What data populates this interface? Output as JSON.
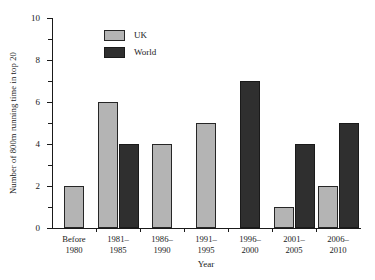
{
  "chart_data": {
    "type": "bar",
    "title": "",
    "xlabel": "Year",
    "ylabel": "Number of 800m running time in top 20",
    "categories": [
      "Before 1980",
      "1981–1985",
      "1986–1990",
      "1991–1995",
      "1996–2000",
      "2001–2005",
      "2006–2010"
    ],
    "category_lines": [
      [
        "Before",
        "1980"
      ],
      [
        "1981–",
        "1985"
      ],
      [
        "1986–",
        "1990"
      ],
      [
        "1991–",
        "1995"
      ],
      [
        "1996–",
        "2000"
      ],
      [
        "2001–",
        "2005"
      ],
      [
        "2006–",
        "2010"
      ]
    ],
    "series": [
      {
        "name": "UK",
        "color": "#b4b4b4",
        "values": [
          2,
          6,
          4,
          5,
          0,
          1,
          2
        ]
      },
      {
        "name": "World",
        "color": "#2f2f2f",
        "values": [
          0,
          4,
          0,
          0,
          7,
          4,
          5
        ]
      }
    ],
    "ylim": [
      0,
      10
    ],
    "ytick_labels": [
      "0",
      "2",
      "4",
      "6",
      "8",
      "10"
    ],
    "ytick_values": [
      0,
      2,
      4,
      6,
      8,
      10
    ],
    "yminor_values": [
      1,
      3,
      5,
      7,
      9
    ],
    "grid": false,
    "legend_position": "top-center"
  },
  "legend": {
    "entries": [
      {
        "label": "UK"
      },
      {
        "label": "World"
      }
    ]
  },
  "axes": {
    "x_title": "Year",
    "y_title": "Number of  800m running time in top 20"
  }
}
